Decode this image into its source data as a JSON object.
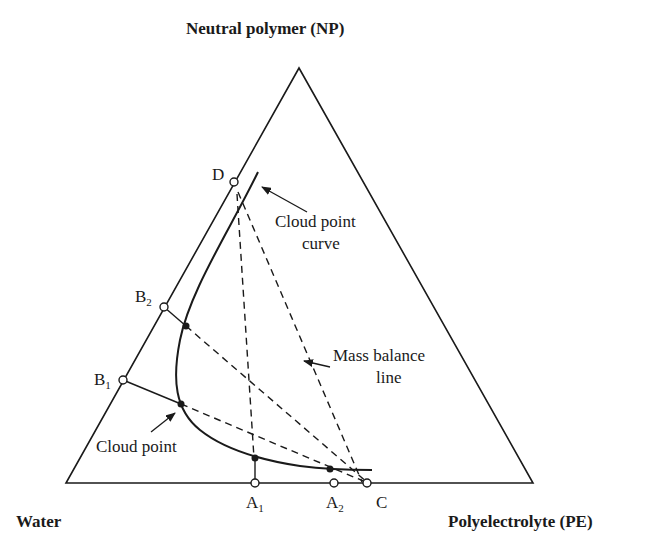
{
  "vertices": {
    "top": "Neutral polymer (NP)",
    "left": "Water",
    "right": "Polyelectrolyte (PE)"
  },
  "points": {
    "D": "D",
    "B2": {
      "main": "B",
      "sub": "2"
    },
    "B1": {
      "main": "B",
      "sub": "1"
    },
    "A1": {
      "main": "A",
      "sub": "1"
    },
    "A2": {
      "main": "A",
      "sub": "2"
    },
    "C": "C"
  },
  "annotations": {
    "cloud_point_curve_line1": "Cloud point",
    "cloud_point_curve_line2": "curve",
    "mass_balance_line1": "Mass balance",
    "mass_balance_line2": "line",
    "cloud_point": "Cloud point"
  },
  "colors": {
    "line": "#1a1a1a",
    "background": "#ffffff"
  }
}
